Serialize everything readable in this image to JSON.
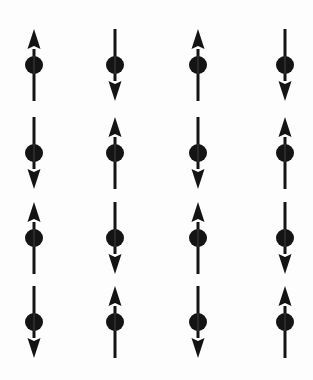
{
  "figure": {
    "background_color": "#fdfdfd",
    "spin_color": "#141414",
    "width": 313,
    "height": 380
  },
  "geometry": {
    "columns_x": [
      34,
      115,
      198,
      285
    ],
    "rows_y": [
      65,
      153,
      238,
      322
    ],
    "arrow_half_length": 36,
    "dot_radius": 9,
    "shaft_width": 3,
    "head_width": 13,
    "head_length": 20
  },
  "legend": {
    "up_label": "spin up",
    "down_label": "spin down"
  },
  "chart_data": {
    "type": "heatmap",
    "xlabel": "",
    "ylabel": "",
    "grid": false,
    "legend_position": "none",
    "rows": 4,
    "columns": 4,
    "value_labels": {
      "1": "up",
      "-1": "down"
    },
    "values": [
      [
        1,
        -1,
        1,
        -1
      ],
      [
        -1,
        1,
        -1,
        1
      ],
      [
        1,
        -1,
        1,
        -1
      ],
      [
        -1,
        1,
        -1,
        1
      ]
    ],
    "sites": [
      {
        "row": 1,
        "col": 1,
        "x": 34,
        "y": 65,
        "spin": 1,
        "direction": "up"
      },
      {
        "row": 1,
        "col": 2,
        "x": 115,
        "y": 65,
        "spin": -1,
        "direction": "down"
      },
      {
        "row": 1,
        "col": 3,
        "x": 198,
        "y": 65,
        "spin": 1,
        "direction": "up"
      },
      {
        "row": 1,
        "col": 4,
        "x": 285,
        "y": 65,
        "spin": -1,
        "direction": "down"
      },
      {
        "row": 2,
        "col": 1,
        "x": 34,
        "y": 153,
        "spin": -1,
        "direction": "down"
      },
      {
        "row": 2,
        "col": 2,
        "x": 115,
        "y": 153,
        "spin": 1,
        "direction": "up"
      },
      {
        "row": 2,
        "col": 3,
        "x": 198,
        "y": 153,
        "spin": -1,
        "direction": "down"
      },
      {
        "row": 2,
        "col": 4,
        "x": 285,
        "y": 153,
        "spin": 1,
        "direction": "up"
      },
      {
        "row": 3,
        "col": 1,
        "x": 34,
        "y": 238,
        "spin": 1,
        "direction": "up"
      },
      {
        "row": 3,
        "col": 2,
        "x": 115,
        "y": 238,
        "spin": -1,
        "direction": "down"
      },
      {
        "row": 3,
        "col": 3,
        "x": 198,
        "y": 238,
        "spin": 1,
        "direction": "up"
      },
      {
        "row": 3,
        "col": 4,
        "x": 285,
        "y": 238,
        "spin": -1,
        "direction": "down"
      },
      {
        "row": 4,
        "col": 1,
        "x": 34,
        "y": 322,
        "spin": -1,
        "direction": "down"
      },
      {
        "row": 4,
        "col": 2,
        "x": 115,
        "y": 322,
        "spin": 1,
        "direction": "up"
      },
      {
        "row": 4,
        "col": 3,
        "x": 198,
        "y": 322,
        "spin": -1,
        "direction": "down"
      },
      {
        "row": 4,
        "col": 4,
        "x": 285,
        "y": 322,
        "spin": 1,
        "direction": "up"
      }
    ]
  }
}
